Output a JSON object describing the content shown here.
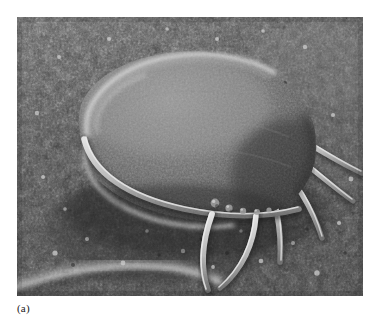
{
  "figure": {
    "caption_label": "(a)",
    "panel_letter": "a"
  },
  "micrograph": {
    "modality": "scanning-electron-micrograph",
    "rendering": "grayscale",
    "frame": {
      "x": 17,
      "y": 17,
      "width": 346,
      "height": 279
    },
    "palette": {
      "page_background": "#ffffff",
      "substrate_dark": "#3c3c3c",
      "substrate_mid": "#5e5e5e",
      "substrate_light": "#8e8e8e",
      "body_dark": "#4b4b4b",
      "body_mid": "#6a6a6a",
      "body_highlight": "#a9a9a9",
      "rim_highlight": "#d8d8d8",
      "flagellum_core": "#c9c9c9",
      "flagellum_shadow": "#3a3a3a"
    },
    "subject": {
      "name": "flagellate-protozoan-trophozoite",
      "shape": "pear-shaped teardrop body",
      "orientation": "anterior toward upper-left, posterior toward lower-right",
      "body_center_x": 172,
      "body_center_y": 118,
      "body_width": 228,
      "body_height": 150,
      "body_rotation_deg": -18
    },
    "features": [
      {
        "name": "anterior-rim-highlight",
        "description": "bright crescent ridge along the anterior-left margin of the cell body"
      },
      {
        "name": "ventral-disc-margin",
        "description": "bright curved lip running along the lower-left edge of the body"
      },
      {
        "name": "anterolateral-flagellum",
        "description": "long flagellum emerging from beneath the anterior-left margin and sweeping right"
      },
      {
        "name": "ventral-flagellum-pair",
        "description": "two flagella descending from the ventral midline and converging toward the lower center"
      },
      {
        "name": "posterior-flagella-fan",
        "description": "fan of three to four caudal flagella radiating to the right and lower-right"
      },
      {
        "name": "marginal-beads",
        "description": "small round granules along the ventral margin of the cell"
      },
      {
        "name": "substrate-ridge",
        "description": "bright diagonal ridge of the filter substrate crossing the lower-left corner"
      },
      {
        "name": "substrate-granules",
        "description": "dense granular texture of the membrane filter covering the entire field"
      }
    ]
  }
}
